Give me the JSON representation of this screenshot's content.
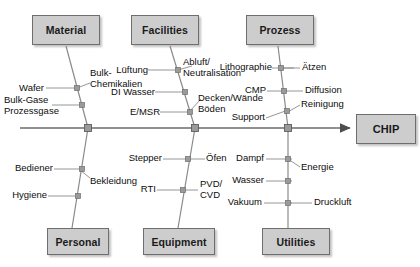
{
  "diagram": {
    "type": "fishbone-ishikawa",
    "effect": {
      "label": "CHIP"
    },
    "spine": {
      "y": 128,
      "x_start": 20,
      "x_end": 352
    },
    "categories": [
      {
        "id": "material",
        "label": "Material",
        "position": "top",
        "box": {
          "x": 32,
          "y": 15,
          "w": 68,
          "h": 30
        },
        "spine_node_x": 88,
        "causes": [
          {
            "label": "Wafer",
            "side": "left"
          },
          {
            "label": "Bulk-\nChemikalien",
            "side": "right"
          },
          {
            "label": "Bulk-Gase\nProzessgase",
            "side": "left"
          }
        ]
      },
      {
        "id": "facilities",
        "label": "Facilities",
        "position": "top",
        "box": {
          "x": 131,
          "y": 15,
          "w": 68,
          "h": 30
        },
        "spine_node_x": 195,
        "causes": [
          {
            "label": "Lüftung",
            "side": "left"
          },
          {
            "label": "Abluft/\nNeutralisation",
            "side": "right"
          },
          {
            "label": "DI Wasser",
            "side": "left"
          },
          {
            "label": "Decken/Wände\nBöden",
            "side": "right"
          },
          {
            "label": "E/MSR",
            "side": "left"
          }
        ]
      },
      {
        "id": "prozess",
        "label": "Prozess",
        "position": "top",
        "box": {
          "x": 246,
          "y": 15,
          "w": 68,
          "h": 30
        },
        "spine_node_x": 288,
        "causes": [
          {
            "label": "Lithographie",
            "side": "left"
          },
          {
            "label": "Ätzen",
            "side": "right"
          },
          {
            "label": "CMP",
            "side": "left"
          },
          {
            "label": "Diffusion",
            "side": "right"
          },
          {
            "label": "Reinigung",
            "side": "right"
          },
          {
            "label": "Support",
            "side": "left"
          }
        ]
      },
      {
        "id": "personal",
        "label": "Personal",
        "position": "bottom",
        "box": {
          "x": 47,
          "y": 228,
          "w": 62,
          "h": 27
        },
        "spine_node_x": 88,
        "causes": [
          {
            "label": "Bediener",
            "side": "left"
          },
          {
            "label": "Bekleidung",
            "side": "right"
          },
          {
            "label": "Hygiene",
            "side": "left"
          }
        ]
      },
      {
        "id": "equipment",
        "label": "Equipment",
        "position": "bottom",
        "box": {
          "x": 143,
          "y": 228,
          "w": 72,
          "h": 27
        },
        "spine_node_x": 195,
        "causes": [
          {
            "label": "Stepper",
            "side": "left"
          },
          {
            "label": "Öfen",
            "side": "right"
          },
          {
            "label": "RTI",
            "side": "left"
          },
          {
            "label": "PVD/\nCVD",
            "side": "right"
          }
        ]
      },
      {
        "id": "utilities",
        "label": "Utilities",
        "position": "bottom",
        "box": {
          "x": 262,
          "y": 228,
          "w": 68,
          "h": 27
        },
        "spine_node_x": 288,
        "causes": [
          {
            "label": "Dampf",
            "side": "left"
          },
          {
            "label": "Energie",
            "side": "right"
          },
          {
            "label": "Wasser",
            "side": "left"
          },
          {
            "label": "Vakuum",
            "side": "left"
          },
          {
            "label": "Druckluft",
            "side": "right"
          }
        ]
      }
    ],
    "colors": {
      "box_fill": "#cdcdcd",
      "box_border": "#6e6e6e",
      "line": "#7a7a7a",
      "spine": "#6b6b6b",
      "text": "#111111",
      "background": "#ffffff"
    }
  }
}
